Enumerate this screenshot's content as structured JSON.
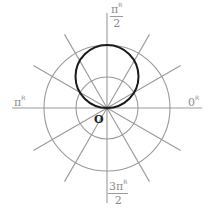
{
  "diagram": {
    "type": "polar-graph",
    "center": [
      107,
      108
    ],
    "grid": {
      "circle_radii_px": [
        31,
        63
      ],
      "ray_angles_deg": [
        0,
        30,
        60,
        90,
        120,
        150,
        180,
        210,
        240,
        270,
        300,
        330
      ],
      "ray_length_px": 93,
      "grid_color": "#9a9a9a",
      "curve_color": "#1a1a1a"
    },
    "curve": {
      "equation": "r = sin θ",
      "description": "circle through the pole, diameter along π/2 axis",
      "diameter_px": 63
    },
    "labels": {
      "top": {
        "num": "π",
        "sup": "R",
        "den": "2"
      },
      "left": {
        "text": "π",
        "sup": "R"
      },
      "right": {
        "text": "0",
        "sup": "R"
      },
      "bottom": {
        "num": "3π",
        "sup": "R",
        "den": "2"
      },
      "origin": "O"
    }
  }
}
